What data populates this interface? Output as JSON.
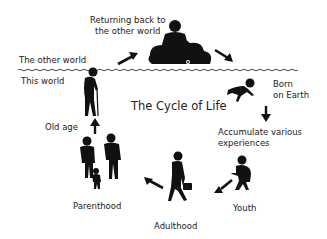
{
  "title": "The Cycle of Life",
  "regions": {
    "upper": "The other world",
    "lower": "This world"
  },
  "stages": {
    "returning": [
      "Returning back to",
      "the other world"
    ],
    "born": [
      "Born",
      "on Earth"
    ],
    "accumulate": [
      "Accumulate various",
      "experiences"
    ],
    "youth": "Youth",
    "adulthood": "Adulthood",
    "parenthood": "Parenthood",
    "old_age": "Old age"
  },
  "colors": {
    "ink": "#111111",
    "text": "#222222",
    "background": "#ffffff"
  }
}
